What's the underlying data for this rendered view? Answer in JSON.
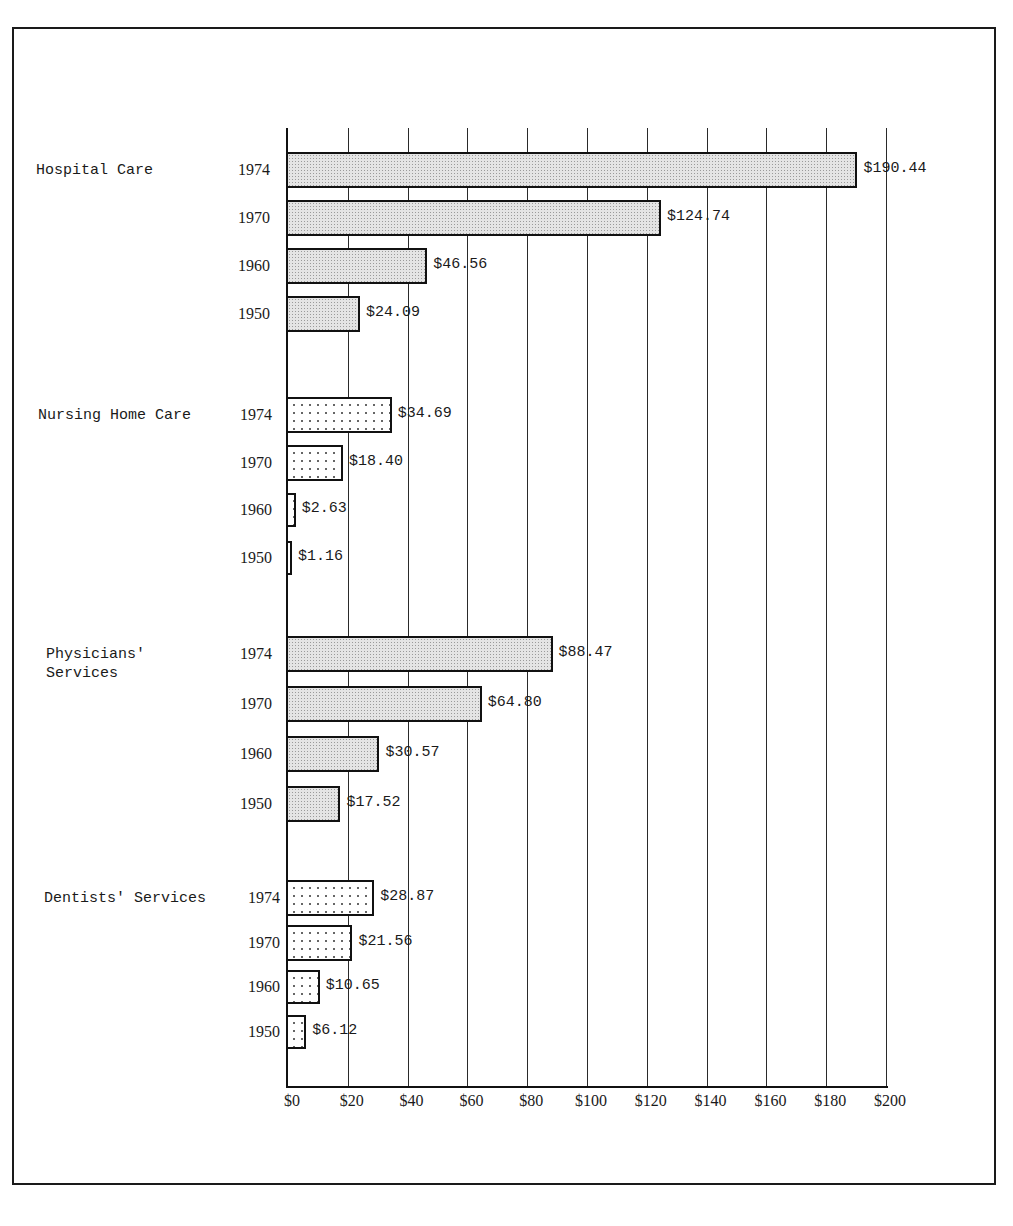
{
  "chart_data": {
    "type": "bar",
    "orientation": "horizontal",
    "title": "",
    "xlabel": "",
    "ylabel": "",
    "xlim": [
      0,
      200
    ],
    "grid": true,
    "x_ticks": [
      "$0",
      "$20",
      "$40",
      "$60",
      "$80",
      "$100",
      "$120",
      "$140",
      "$160",
      "$180",
      "$200"
    ],
    "groups": [
      {
        "name": "Hospital Care",
        "pattern": "shaded",
        "bars": [
          {
            "year": "1974",
            "value": 190.44,
            "label": "$190.44"
          },
          {
            "year": "1970",
            "value": 124.74,
            "label": "$124.74"
          },
          {
            "year": "1960",
            "value": 46.56,
            "label": "$46.56"
          },
          {
            "year": "1950",
            "value": 24.09,
            "label": "$24.09"
          }
        ]
      },
      {
        "name": "Nursing Home Care",
        "pattern": "dotted",
        "bars": [
          {
            "year": "1974",
            "value": 34.69,
            "label": "$34.69"
          },
          {
            "year": "1970",
            "value": 18.4,
            "label": "$18.40"
          },
          {
            "year": "1960",
            "value": 2.63,
            "label": "$2.63"
          },
          {
            "year": "1950",
            "value": 1.16,
            "label": "$1.16"
          }
        ]
      },
      {
        "name": "Physicians'\nServices",
        "pattern": "shaded",
        "bars": [
          {
            "year": "1974",
            "value": 88.47,
            "label": "$88.47"
          },
          {
            "year": "1970",
            "value": 64.8,
            "label": "$64.80"
          },
          {
            "year": "1960",
            "value": 30.57,
            "label": "$30.57"
          },
          {
            "year": "1950",
            "value": 17.52,
            "label": "$17.52"
          }
        ]
      },
      {
        "name": "Dentists' Services",
        "pattern": "dotted",
        "bars": [
          {
            "year": "1974",
            "value": 28.87,
            "label": "$28.87"
          },
          {
            "year": "1970",
            "value": 21.56,
            "label": "$21.56"
          },
          {
            "year": "1960",
            "value": 10.65,
            "label": "$10.65"
          },
          {
            "year": "1950",
            "value": 6.12,
            "label": "$6.12"
          }
        ]
      }
    ],
    "categories": [
      "Hospital Care",
      "Nursing Home Care",
      "Physicians' Services",
      "Dentists' Services"
    ],
    "series": [
      {
        "name": "1974",
        "values": [
          190.44,
          34.69,
          88.47,
          28.87
        ]
      },
      {
        "name": "1970",
        "values": [
          124.74,
          18.4,
          64.8,
          21.56
        ]
      },
      {
        "name": "1960",
        "values": [
          46.56,
          2.63,
          30.57,
          10.65
        ]
      },
      {
        "name": "1950",
        "values": [
          24.09,
          1.16,
          17.52,
          6.12
        ]
      }
    ]
  }
}
